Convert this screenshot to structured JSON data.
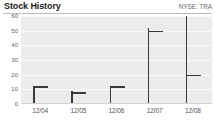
{
  "header": {
    "title": "Stock History",
    "ticker": "NYSE: TRA"
  },
  "chart_data": {
    "type": "bar",
    "title": "Stock History",
    "subtitle": "NYSE: TRA",
    "xlabel": "",
    "ylabel": "",
    "ylim": [
      0,
      60
    ],
    "yticks": [
      0,
      10,
      20,
      30,
      40,
      50,
      60
    ],
    "grid": true,
    "legend": "none",
    "categories": [
      "12/04",
      "12/05",
      "12/06",
      "12/07",
      "12/08"
    ],
    "series": [
      {
        "name": "High",
        "values": [
          12,
          9,
          12,
          52,
          60
        ]
      },
      {
        "name": "Low",
        "values": [
          1,
          1,
          1,
          1,
          1
        ]
      },
      {
        "name": "Close",
        "values": [
          12,
          8,
          12,
          50,
          20
        ]
      }
    ],
    "marks": [
      {
        "x": "12/04",
        "high": 12,
        "low": 1,
        "close": 12,
        "tick_side": "right"
      },
      {
        "x": "12/05",
        "high": 9,
        "low": 1,
        "close": 8,
        "tick_side": "right"
      },
      {
        "x": "12/06",
        "high": 12,
        "low": 1,
        "close": 12,
        "tick_side": "right"
      },
      {
        "x": "12/07",
        "high": 52,
        "low": 1,
        "close": 50,
        "tick_side": "right"
      },
      {
        "x": "12/08",
        "high": 60,
        "low": 1,
        "close": 20,
        "tick_side": "right"
      }
    ]
  },
  "colors": {
    "mark": "#3a3a3a",
    "plot_background": "#ececec",
    "gridline": "#fafafa",
    "title_text": "#1b1b1b",
    "axis_text": "#5d6166",
    "rule": "#b9bcc0"
  }
}
